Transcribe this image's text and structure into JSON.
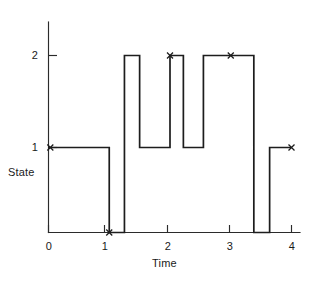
{
  "chart_data": {
    "type": "line",
    "subtype": "step-post",
    "title": "",
    "xlabel": "Time",
    "ylabel": "State",
    "xlim": [
      0,
      4.15
    ],
    "ylim": [
      0,
      2.45
    ],
    "xticks": [
      0,
      1,
      2,
      3,
      4
    ],
    "xtick_labels": [
      "0",
      "1",
      "2",
      "3",
      "4"
    ],
    "yticks": [
      1,
      2
    ],
    "ytick_labels": [
      "1",
      "2"
    ],
    "grid": false,
    "legend": null,
    "line_color": "#1d1d1d",
    "axis_color": "#2b2b2b",
    "background_color": "#ffffff",
    "series": [
      {
        "name": "State",
        "step_segments": [
          {
            "t_start": 0.0,
            "t_end": 1.0,
            "state": 1
          },
          {
            "t_start": 1.0,
            "t_end": 1.25,
            "state": 0
          },
          {
            "t_start": 1.25,
            "t_end": 1.5,
            "state": 2
          },
          {
            "t_start": 1.5,
            "t_end": 2.0,
            "state": 1
          },
          {
            "t_start": 2.0,
            "t_end": 2.22,
            "state": 2
          },
          {
            "t_start": 2.22,
            "t_end": 2.55,
            "state": 1
          },
          {
            "t_start": 2.55,
            "t_end": 3.38,
            "state": 2
          },
          {
            "t_start": 3.38,
            "t_end": 3.64,
            "state": 0
          },
          {
            "t_start": 3.64,
            "t_end": 4.0,
            "state": 1
          }
        ]
      }
    ],
    "markers": [
      {
        "label": "x",
        "t": 0.03,
        "state": 1
      },
      {
        "label": "x",
        "t": 1.0,
        "state": 0
      },
      {
        "label": "x",
        "t": 2.0,
        "state": 2
      },
      {
        "label": "x",
        "t": 3.0,
        "state": 2
      },
      {
        "label": "x",
        "t": 4.0,
        "state": 1
      }
    ],
    "annotations": []
  }
}
